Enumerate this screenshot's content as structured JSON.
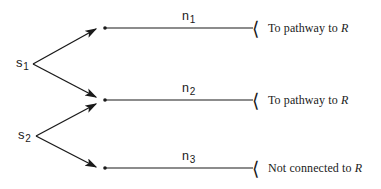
{
  "figure": {
    "background_color": "#ffffff",
    "ink_color": "#1a1a1a"
  },
  "sources": [
    {
      "id": "s1",
      "base": "s",
      "subscript": "1",
      "x": 16,
      "y": 56,
      "branch_x": 33,
      "branch_y": 64
    },
    {
      "id": "s2",
      "base": "s",
      "subscript": "2",
      "x": 18,
      "y": 128,
      "branch_x": 36,
      "branch_y": 136
    }
  ],
  "edges": [
    {
      "id": "n1",
      "base": "n",
      "subscript": "1",
      "label_x": 182,
      "label_y": 10,
      "line_y": 28,
      "line_x_start": 104,
      "line_x_end": 253,
      "bracket_glyph": "⟨",
      "bracket_x": 253,
      "destination": "To pathway to ",
      "destination_symbol": "R",
      "destination_x": 268,
      "from_sources": [
        "s1"
      ]
    },
    {
      "id": "n2",
      "base": "n",
      "subscript": "2",
      "label_x": 182,
      "label_y": 82,
      "line_y": 100,
      "line_x_start": 104,
      "line_x_end": 253,
      "bracket_glyph": "⟨",
      "bracket_x": 253,
      "destination": "To pathway to ",
      "destination_symbol": "R",
      "destination_x": 268,
      "from_sources": [
        "s1",
        "s2"
      ]
    },
    {
      "id": "n3",
      "base": "n",
      "subscript": "3",
      "label_x": 182,
      "label_y": 150,
      "line_y": 168,
      "line_x_start": 104,
      "line_x_end": 253,
      "bracket_glyph": "⟨",
      "bracket_x": 253,
      "destination": "Not connected to ",
      "destination_symbol": "R",
      "destination_x": 268,
      "from_sources": [
        "s2"
      ]
    }
  ],
  "arrows": [
    {
      "id": "s1-to-n1",
      "x1": 33,
      "y1": 64,
      "x2": 98,
      "y2": 28
    },
    {
      "id": "s1-to-n2",
      "x1": 33,
      "y1": 64,
      "x2": 98,
      "y2": 97
    },
    {
      "id": "s2-to-n2",
      "x1": 36,
      "y1": 136,
      "x2": 98,
      "y2": 103
    },
    {
      "id": "s2-to-n3",
      "x1": 36,
      "y1": 136,
      "x2": 98,
      "y2": 168
    }
  ]
}
